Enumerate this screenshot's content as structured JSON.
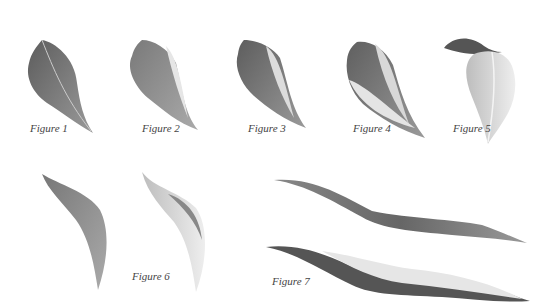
{
  "figures": [
    {
      "label": "Figure 1"
    },
    {
      "label": "Figure 2"
    },
    {
      "label": "Figure 3"
    },
    {
      "label": "Figure 4"
    },
    {
      "label": "Figure 5"
    },
    {
      "label": "Figure 6"
    },
    {
      "label": "Figure 7"
    }
  ],
  "colors": {
    "dark": "#4a4a4a",
    "mid": "#7a7a7a",
    "light": "#c8c8c8",
    "highlight": "#e8e8e8"
  }
}
